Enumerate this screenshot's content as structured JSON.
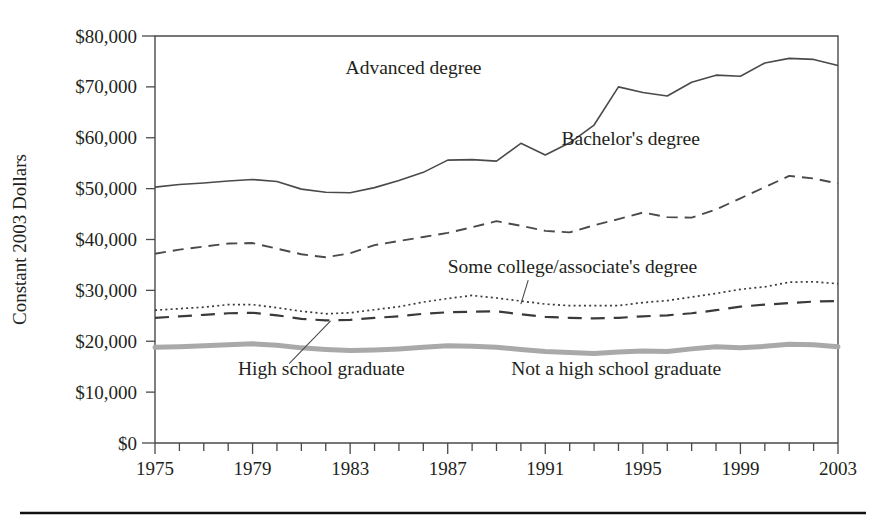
{
  "chart_data": {
    "type": "line",
    "title": "",
    "xlabel": "",
    "ylabel": "Constant 2003 Dollars",
    "xlim": [
      1975,
      2003
    ],
    "ylim": [
      0,
      80000
    ],
    "grid": false,
    "legend_position": "inline-annotations",
    "x": [
      1975,
      1976,
      1977,
      1978,
      1979,
      1980,
      1981,
      1982,
      1983,
      1984,
      1985,
      1986,
      1987,
      1988,
      1989,
      1990,
      1991,
      1992,
      1993,
      1994,
      1995,
      1996,
      1997,
      1998,
      1999,
      2000,
      2001,
      2002,
      2003
    ],
    "x_tick_labels": [
      "1975",
      "1979",
      "1983",
      "1987",
      "1991",
      "1995",
      "1999",
      "2003"
    ],
    "x_tick_values": [
      1975,
      1979,
      1983,
      1987,
      1991,
      1995,
      1999,
      2003
    ],
    "y_tick_labels": [
      "$0",
      "$10,000",
      "$20,000",
      "$30,000",
      "$40,000",
      "$50,000",
      "$60,000",
      "$70,000",
      "$80,000"
    ],
    "y_tick_values": [
      0,
      10000,
      20000,
      30000,
      40000,
      50000,
      60000,
      70000,
      80000
    ],
    "series": [
      {
        "name": "Advanced degree",
        "style": "solid-thin",
        "color": "#4a4a4a",
        "width": 1.6,
        "label_x": 1985.6,
        "label_y": 72600,
        "values": [
          50300,
          50800,
          51100,
          51500,
          51800,
          51400,
          49900,
          49300,
          49200,
          50200,
          51600,
          53200,
          55600,
          55700,
          55400,
          58900,
          56600,
          59000,
          62500,
          70000,
          68900,
          68200,
          70900,
          72300,
          72100,
          74700,
          75600,
          75400,
          74200
        ]
      },
      {
        "name": "Bachelor's degree",
        "style": "dashed",
        "color": "#4a4a4a",
        "width": 1.9,
        "label_x": 1994.5,
        "label_y": 58500,
        "values": [
          37200,
          38000,
          38600,
          39200,
          39300,
          38200,
          37100,
          36500,
          37300,
          38900,
          39700,
          40500,
          41300,
          42400,
          43600,
          42700,
          41700,
          41400,
          42800,
          44000,
          45300,
          44400,
          44300,
          45900,
          48100,
          50300,
          52500,
          52000,
          51000
        ]
      },
      {
        "name": "Some college/associate's degree",
        "style": "dotted",
        "color": "#3a3a3a",
        "width": 1.7,
        "label_x": 1987.0,
        "label_y": 33500,
        "label_anchor": "start",
        "leader_from": [
          1990.3,
          32000
        ],
        "leader_to": [
          1990.0,
          27300
        ],
        "values": [
          26100,
          26400,
          26700,
          27200,
          27200,
          26600,
          25900,
          25400,
          25600,
          26200,
          26800,
          27700,
          28400,
          29000,
          28500,
          27900,
          27300,
          27000,
          27000,
          27000,
          27600,
          28000,
          28700,
          29400,
          30200,
          30700,
          31600,
          31700,
          31300
        ]
      },
      {
        "name": "High school graduate",
        "style": "long-dash",
        "color": "#3a3a3a",
        "width": 2.2,
        "label_x": 1978.4,
        "label_y": 13300,
        "label_anchor": "start",
        "leader_from": [
          1980.5,
          15600
        ],
        "leader_to": [
          1982.2,
          24000
        ],
        "values": [
          24600,
          24900,
          25200,
          25500,
          25600,
          25100,
          24400,
          24100,
          24200,
          24600,
          24900,
          25400,
          25700,
          25800,
          25900,
          25300,
          24800,
          24600,
          24500,
          24600,
          24900,
          25100,
          25500,
          26100,
          26800,
          27200,
          27500,
          27800,
          27900
        ]
      },
      {
        "name": "Not a high school graduate",
        "style": "thick-solid",
        "color": "#a9a9a9",
        "width": 5.0,
        "label_x": 1989.6,
        "label_y": 13300,
        "label_anchor": "start",
        "values": [
          18800,
          18900,
          19100,
          19300,
          19500,
          19200,
          18700,
          18400,
          18200,
          18300,
          18500,
          18800,
          19100,
          19000,
          18800,
          18400,
          18000,
          17800,
          17600,
          17900,
          18100,
          18000,
          18500,
          18900,
          18700,
          19000,
          19400,
          19300,
          18900
        ]
      }
    ]
  },
  "figure": {
    "bottom_rule": true
  }
}
